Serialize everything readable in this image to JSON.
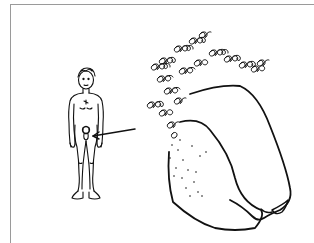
{
  "illustration": {
    "description": "Pen-and-ink illustration: small standing male figure with an arrow pointing from the groin area to an enlarged detail drawing at right",
    "small_figure": {
      "label": "standing-figure"
    },
    "arrow": {
      "from": [
        135,
        129
      ],
      "to": [
        92,
        136
      ]
    },
    "enlarged_detail": {
      "label": "enlarged-detail"
    }
  },
  "colors": {
    "ink": "#111111",
    "frame": "#9a9a9a",
    "background": "#ffffff"
  }
}
